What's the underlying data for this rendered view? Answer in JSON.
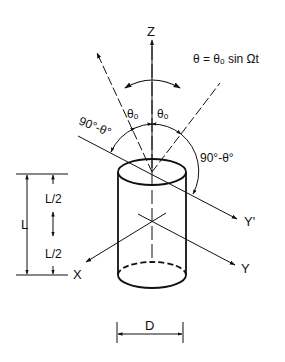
{
  "diagram": {
    "type": "technical-drawing",
    "colors": {
      "ink": "#111111",
      "background": "#ffffff"
    },
    "axes": {
      "z_label": "Z",
      "x_label": "X",
      "y_label": "Y",
      "y_prime_label": "Y'"
    },
    "equation": "θ = θₒ sin Ωt",
    "angles": {
      "theta_left": "θₒ",
      "theta_right": "θₒ",
      "complement_left": "90°-θ°",
      "complement_right": "90°-θ°"
    },
    "dimensions": {
      "length": "L",
      "half_length_top": "L/2",
      "half_length_bottom": "L/2",
      "diameter": "D"
    }
  }
}
